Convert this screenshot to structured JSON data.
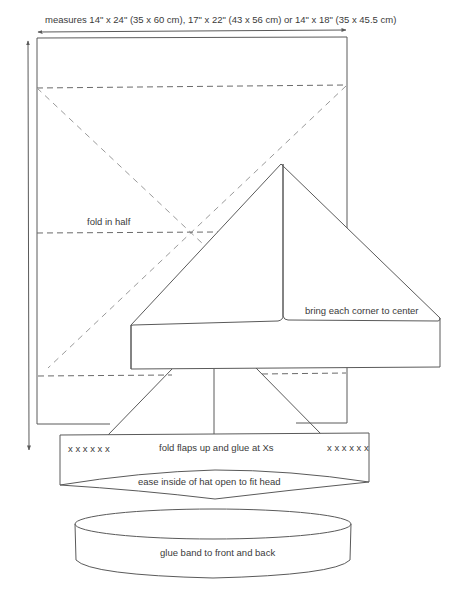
{
  "diagram": {
    "dimension_label": "measures 14\" x 24\" (35 x 60 cm), 17\" x 22\" (43 x 56 cm) or 14\" x 18\" (35 x 45.5 cm)",
    "steps": [
      {
        "id": "step1",
        "label": "fold in half"
      },
      {
        "id": "step2",
        "label": "bring each corner to center"
      },
      {
        "id": "step3",
        "label": "fold flaps up and glue at Xs"
      },
      {
        "id": "step4",
        "label": "ease inside of hat open to fit head"
      },
      {
        "id": "step5",
        "label": "glue band to front and back"
      }
    ],
    "glue_marks_left": "x x x x x x",
    "glue_marks_right": "x x x x x x",
    "colors": {
      "line": "#5a5a5a",
      "dashed": "#6a6a6a",
      "text": "#3a3a3a",
      "background": "#ffffff"
    }
  }
}
